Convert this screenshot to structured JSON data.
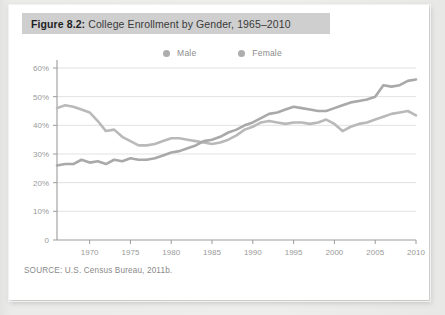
{
  "figure": {
    "label": "Figure 8.2:",
    "title": "College Enrollment by Gender, 1965–2010",
    "source": "SOURCE: U.S. Census Bureau, 2011b."
  },
  "legend": {
    "position": "top-center",
    "items": [
      {
        "name": "Male",
        "marker": "legend-dot-male",
        "color": "#a8a8a8"
      },
      {
        "name": "Female",
        "marker": "legend-dot-female",
        "color": "#b5b5b5"
      }
    ]
  },
  "colors": {
    "card": "#ffffff",
    "page_background": "#e9e9e7",
    "title_band": "#cfcfcf",
    "gridline": "#e2e2e2",
    "axis": "#9b9b9b",
    "tick_text": "#9a9a9a",
    "male_line": "#b9b9b9",
    "female_line": "#a9a9a9"
  },
  "chart_data": {
    "type": "line",
    "title": "College Enrollment by Gender, 1965–2010",
    "xlabel": "",
    "ylabel": "",
    "xlim": [
      1966,
      2010
    ],
    "ylim": [
      0,
      60
    ],
    "grid": true,
    "y_ticks": [
      0,
      10,
      20,
      30,
      40,
      50,
      60
    ],
    "y_tick_labels": [
      "0",
      "10%",
      "20%",
      "30%",
      "40%",
      "50%",
      "60%"
    ],
    "x_ticks": [
      1970,
      1975,
      1980,
      1985,
      1990,
      1995,
      2000,
      2005,
      2010
    ],
    "x_tick_labels": [
      "1970",
      "1975",
      "1980",
      "1985",
      "1990",
      "1995",
      "2000",
      "2005",
      "2010"
    ],
    "x": [
      1966,
      1967,
      1968,
      1969,
      1970,
      1971,
      1972,
      1973,
      1974,
      1975,
      1976,
      1977,
      1978,
      1979,
      1980,
      1981,
      1982,
      1983,
      1984,
      1985,
      1986,
      1987,
      1988,
      1989,
      1990,
      1991,
      1992,
      1993,
      1994,
      1995,
      1996,
      1997,
      1998,
      1999,
      2000,
      2001,
      2002,
      2003,
      2004,
      2005,
      2006,
      2007,
      2008,
      2009,
      2010
    ],
    "series": [
      {
        "name": "Male",
        "color": "#b9b9b9",
        "values": [
          46.0,
          47.0,
          46.5,
          45.5,
          44.5,
          41.5,
          38.0,
          38.5,
          36.0,
          34.5,
          33.0,
          33.0,
          33.5,
          34.5,
          35.5,
          35.5,
          35.0,
          34.5,
          34.0,
          33.5,
          34.0,
          35.0,
          36.5,
          38.5,
          39.5,
          41.0,
          41.5,
          41.0,
          40.5,
          41.0,
          41.0,
          40.5,
          41.0,
          42.0,
          40.5,
          38.0,
          39.5,
          40.5,
          41.0,
          42.0,
          43.0,
          44.0,
          44.5,
          45.0,
          43.5
        ]
      },
      {
        "name": "Female",
        "color": "#a9a9a9",
        "values": [
          26.0,
          26.5,
          26.5,
          28.0,
          27.0,
          27.5,
          26.5,
          28.0,
          27.5,
          28.5,
          28.0,
          28.0,
          28.5,
          29.5,
          30.5,
          31.0,
          32.0,
          33.0,
          34.5,
          35.0,
          36.0,
          37.5,
          38.5,
          40.0,
          41.0,
          42.5,
          44.0,
          44.5,
          45.5,
          46.5,
          46.0,
          45.5,
          45.0,
          45.0,
          46.0,
          47.0,
          48.0,
          48.5,
          49.0,
          50.0,
          54.0,
          53.5,
          54.0,
          55.5,
          56.0
        ]
      }
    ],
    "annotations": []
  }
}
